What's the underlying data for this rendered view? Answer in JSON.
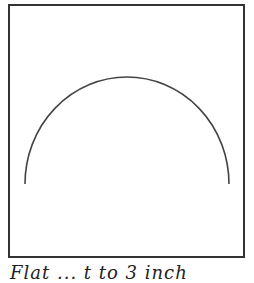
{
  "figure": {
    "frame": {
      "stroke": "#333333"
    },
    "arc": {
      "shape": "semi-ellipse",
      "stroke": "#444444",
      "start": [
        25,
        184
      ],
      "apex": [
        127,
        77
      ],
      "end": [
        229,
        184
      ]
    },
    "caption": "Flat ... t to 3 inch"
  }
}
